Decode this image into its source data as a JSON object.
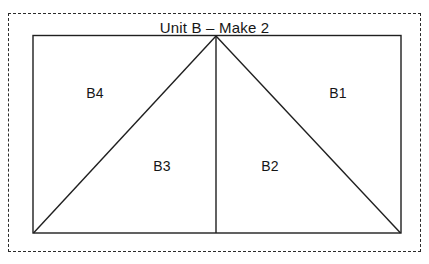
{
  "diagram": {
    "title": "Unit B – Make 2",
    "kind": "quilt-block-cutting-diagram",
    "background_color": "#ffffff",
    "line_color": "#1f1f1f",
    "cut_line": {
      "style": "dashed",
      "color": "#2b2b2b"
    },
    "pieces": [
      {
        "id": "B4",
        "label": "B4",
        "shape": "left triangle"
      },
      {
        "id": "B1",
        "label": "B1",
        "shape": "right triangle"
      },
      {
        "id": "B3",
        "label": "B3",
        "shape": "lower-left triangle"
      },
      {
        "id": "B2",
        "label": "B2",
        "shape": "lower-right triangle"
      }
    ]
  }
}
